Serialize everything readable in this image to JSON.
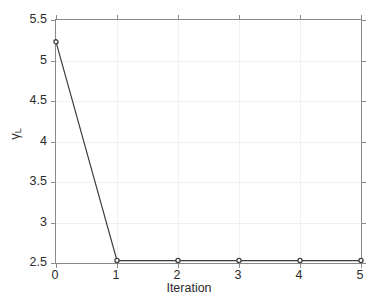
{
  "chart_data": {
    "type": "line",
    "title": "",
    "subtitle": "",
    "xlabel": "Iteration",
    "ylabel": "γL",
    "ylabel_base": "γ",
    "ylabel_sub": "L",
    "x": [
      0,
      1,
      2,
      3,
      4,
      5
    ],
    "values": [
      5.23,
      2.53,
      2.53,
      2.53,
      2.53,
      2.53
    ],
    "series": [
      {
        "name": "γL",
        "x": [
          0,
          1,
          2,
          3,
          4,
          5
        ],
        "values": [
          5.23,
          2.53,
          2.53,
          2.53,
          2.53,
          2.53
        ],
        "color": "#3d3d3d",
        "marker": "circle",
        "line_style": "solid"
      }
    ],
    "xlim": [
      0,
      5
    ],
    "ylim": [
      2.5,
      5.5
    ],
    "xticks": [
      0,
      1,
      2,
      3,
      4,
      5
    ],
    "xtick_labels": [
      "0",
      "1",
      "2",
      "3",
      "4",
      "5"
    ],
    "yticks": [
      2.5,
      3,
      3.5,
      4,
      4.5,
      5,
      5.5
    ],
    "ytick_labels": [
      "2.5",
      "3",
      "3.5",
      "4",
      "4.5",
      "5",
      "5.5"
    ],
    "grid": true,
    "grid_color": "#f0f0f0",
    "legend": null,
    "legend_position": "none",
    "axis_color": "#8a8a8a",
    "background": "#ffffff",
    "text_color": "#2b2b2b",
    "annotations": []
  }
}
